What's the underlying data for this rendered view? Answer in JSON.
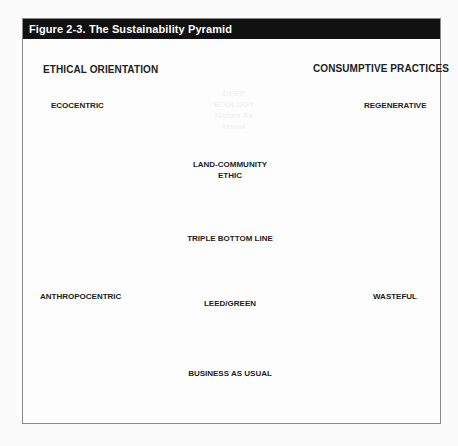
{
  "figure": {
    "title": "Figure 2-3. The Sustainability Pyramid",
    "left_header": "ETHICAL ORIENTATION",
    "right_header": "CONSUMPTIVE PRACTICES",
    "left_axis": {
      "top": "ECOCENTRIC",
      "bottom": "ANTHROPOCENTRIC"
    },
    "right_axis": {
      "top": "REGENERATIVE",
      "bottom": "WASTEFUL"
    },
    "layers": [
      {
        "line1": "DEEP",
        "line2": "ECOLOGY",
        "line3": "Nature As",
        "line4": "Usual",
        "color": "#5a5a5a",
        "text_color": "#f2f2f2"
      },
      {
        "line1": "LAND-COMMUNITY",
        "line2": "ETHIC",
        "color": "#7e7e7e",
        "text_color": "#1e1e1e"
      },
      {
        "line1": "TRIPLE BOTTOM LINE",
        "color": "#999999",
        "text_color": "#1e1e1e"
      },
      {
        "line1": "LEED/GREEN",
        "color": "#a9a9a9",
        "text_color": "#1e1e1e"
      },
      {
        "line1": "BUSINESS AS USUAL",
        "color": "#d0d0d0",
        "text_color": "#1e1e1e"
      }
    ]
  }
}
